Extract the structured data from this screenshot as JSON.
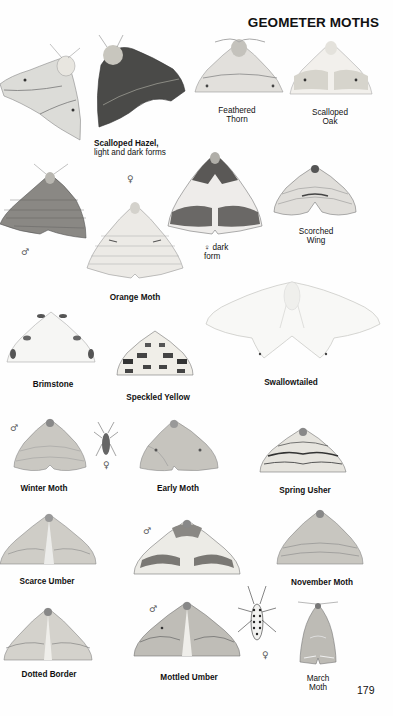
{
  "page": {
    "title": "GEOMETER MOTHS",
    "page_number": "179"
  },
  "species": [
    {
      "id": "scalloped-hazel",
      "name": "Scalloped Hazel,",
      "note": "light and dark forms"
    },
    {
      "id": "feathered-thorn",
      "name": "Feathered Thorn",
      "line1": "Feathered",
      "line2": "Thorn"
    },
    {
      "id": "scalloped-oak",
      "name": "Scalloped Oak",
      "line1": "Scalloped",
      "line2": "Oak"
    },
    {
      "id": "orange-moth",
      "name": "Orange Moth",
      "female_form_note_sym": "♀",
      "female_form_note": "dark",
      "female_form_note2": "form"
    },
    {
      "id": "scorched-wing",
      "name": "Scorched Wing",
      "line1": "Scorched",
      "line2": "Wing"
    },
    {
      "id": "brimstone",
      "name": "Brimstone"
    },
    {
      "id": "speckled-yellow",
      "name": "Speckled Yellow"
    },
    {
      "id": "swallowtailed",
      "name": "Swallowtailed"
    },
    {
      "id": "winter-moth",
      "name": "Winter Moth"
    },
    {
      "id": "early-moth",
      "name": "Early Moth"
    },
    {
      "id": "spring-usher",
      "name": "Spring Usher"
    },
    {
      "id": "scarce-umber",
      "name": "Scarce Umber"
    },
    {
      "id": "november-moth",
      "name": "November Moth"
    },
    {
      "id": "dotted-border",
      "name": "Dotted Border"
    },
    {
      "id": "mottled-umber",
      "name": "Mottled Umber"
    },
    {
      "id": "march-moth",
      "name": "March Moth",
      "line1": "March",
      "line2": "Moth"
    }
  ],
  "symbols": {
    "male": "♂",
    "female": "♀"
  }
}
